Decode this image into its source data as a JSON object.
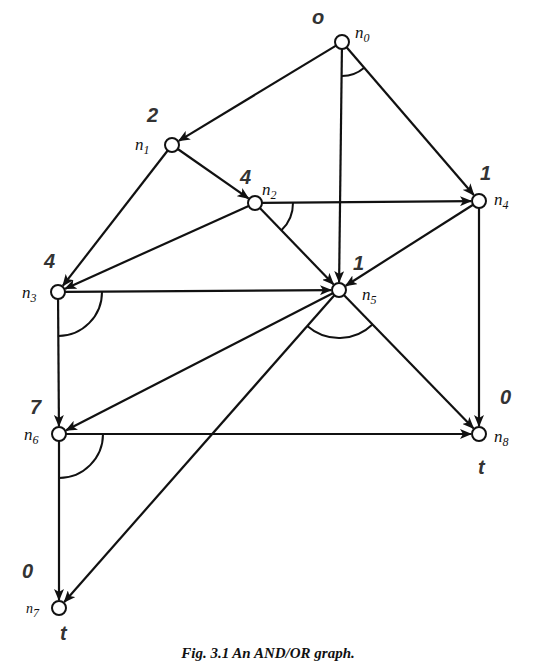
{
  "figure": {
    "caption": "Fig. 3.1 An AND/OR graph."
  },
  "nodes": [
    {
      "id": "n0",
      "label": "n",
      "sub": "0",
      "x": 342,
      "y": 42,
      "value": "o"
    },
    {
      "id": "n1",
      "label": "n",
      "sub": "1",
      "x": 172,
      "y": 145,
      "value": "2"
    },
    {
      "id": "n2",
      "label": "n",
      "sub": "2",
      "x": 255,
      "y": 203,
      "value": "4"
    },
    {
      "id": "n3",
      "label": "n",
      "sub": "3",
      "x": 58,
      "y": 292,
      "value": "4"
    },
    {
      "id": "n4",
      "label": "n",
      "sub": "4",
      "x": 479,
      "y": 201,
      "value": "1"
    },
    {
      "id": "n5",
      "label": "n",
      "sub": "5",
      "x": 339,
      "y": 290,
      "value": "1"
    },
    {
      "id": "n6",
      "label": "n",
      "sub": "6",
      "x": 59,
      "y": 434,
      "value": "7"
    },
    {
      "id": "n7",
      "label": "n",
      "sub": "7",
      "x": 59,
      "y": 608,
      "value": "0",
      "terminal": "t"
    },
    {
      "id": "n8",
      "label": "n",
      "sub": "8",
      "x": 479,
      "y": 434,
      "value": "0",
      "terminal": "t"
    }
  ],
  "edges": [
    [
      "n0",
      "n1"
    ],
    [
      "n0",
      "n5"
    ],
    [
      "n0",
      "n4"
    ],
    [
      "n1",
      "n2"
    ],
    [
      "n1",
      "n3"
    ],
    [
      "n2",
      "n4"
    ],
    [
      "n2",
      "n5"
    ],
    [
      "n2",
      "n3"
    ],
    [
      "n4",
      "n5"
    ],
    [
      "n4",
      "n8"
    ],
    [
      "n3",
      "n5"
    ],
    [
      "n3",
      "n6"
    ],
    [
      "n5",
      "n6"
    ],
    [
      "n5",
      "n8"
    ],
    [
      "n5",
      "n7"
    ],
    [
      "n6",
      "n8"
    ],
    [
      "n6",
      "n7"
    ]
  ],
  "and_arcs": [
    {
      "node": "n0",
      "between": [
        "n5",
        "n4"
      ]
    },
    {
      "node": "n2",
      "between": [
        "n4",
        "n5"
      ]
    },
    {
      "node": "n3",
      "between": [
        "n5",
        "n6"
      ]
    },
    {
      "node": "n5",
      "between": [
        "n7",
        "n8"
      ]
    },
    {
      "node": "n6",
      "between": [
        "n8",
        "n7"
      ]
    }
  ],
  "annotations": {
    "n0_value": "o",
    "n1_value": "2",
    "n2_value": "4",
    "n3_value": "4",
    "n4_value": "1",
    "n5_value": "1",
    "n6_value": "7",
    "n7_value": "0",
    "n8_value": "0",
    "n7_terminal": "t",
    "n8_terminal": "t"
  },
  "labels": {
    "n0": "n",
    "n0_sub": "0",
    "n1": "n",
    "n1_sub": "1",
    "n2": "n",
    "n2_sub": "2",
    "n3": "n",
    "n3_sub": "3",
    "n4": "n",
    "n4_sub": "4",
    "n5": "n",
    "n5_sub": "5",
    "n6": "n",
    "n6_sub": "6",
    "n7": "n",
    "n7_sub": "7",
    "n8": "n",
    "n8_sub": "8"
  }
}
